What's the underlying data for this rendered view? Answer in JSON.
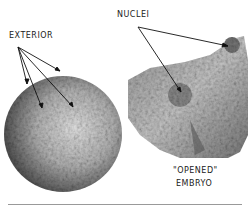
{
  "labels": {
    "exterior": "EXTERIOR",
    "nuclei": "NUCLEI",
    "opened_line1": "\"OPENED\"",
    "opened_line2": "EMBRYO"
  },
  "panels": [
    {
      "name": "exterior-embryo",
      "description": "spherical fossil embryo exterior"
    },
    {
      "name": "opened-embryo",
      "description": "broken-open fossil embryo showing nuclei"
    }
  ]
}
